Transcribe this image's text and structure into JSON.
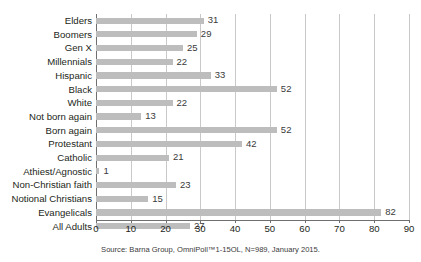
{
  "chart_data": {
    "type": "bar",
    "orientation": "horizontal",
    "title": "",
    "subtitle": "",
    "xlabel": "",
    "ylabel": "",
    "xlim": [
      0,
      90
    ],
    "xticks": [
      0,
      10,
      20,
      30,
      40,
      50,
      60,
      70,
      80,
      90
    ],
    "grid": true,
    "legend": null,
    "categories": [
      "Elders",
      "Boomers",
      "Gen X",
      "Millennials",
      "Hispanic",
      "Black",
      "White",
      "Not born again",
      "Born again",
      "Protestant",
      "Catholic",
      "Athiest/Agnostic",
      "Non-Christian faith",
      "Notional Christians",
      "Evangelicals",
      "All Adults"
    ],
    "values": [
      31,
      29,
      25,
      22,
      33,
      52,
      22,
      13,
      52,
      42,
      21,
      1,
      23,
      15,
      82,
      27
    ],
    "bar_color": "#bdbdbd",
    "gridline_color": "#c9c9c9",
    "axis_color": "#6f6f6f",
    "label_color": "#231f20",
    "annotation": "Source: Barna Group, OmniPoll™1-15OL, N=989, January 2015."
  }
}
